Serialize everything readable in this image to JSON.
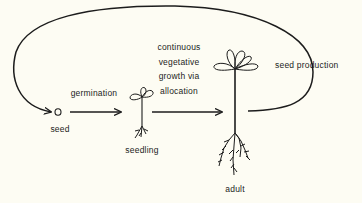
{
  "diagram": {
    "type": "life-cycle",
    "stages": [
      {
        "id": "seed",
        "label": "seed"
      },
      {
        "id": "seedling",
        "label": "seedling"
      },
      {
        "id": "adult",
        "label": "adult"
      }
    ],
    "transitions": [
      {
        "from": "seed",
        "to": "seedling",
        "label": "germination"
      },
      {
        "from": "seedling",
        "to": "adult",
        "label_lines": [
          "continuous",
          "vegetative",
          "growth via",
          "allocation"
        ]
      },
      {
        "from": "adult",
        "to": "seed",
        "label": "seed production"
      }
    ]
  },
  "colors": {
    "background": "#fdfcf3",
    "ink": "#1c1c1c"
  }
}
